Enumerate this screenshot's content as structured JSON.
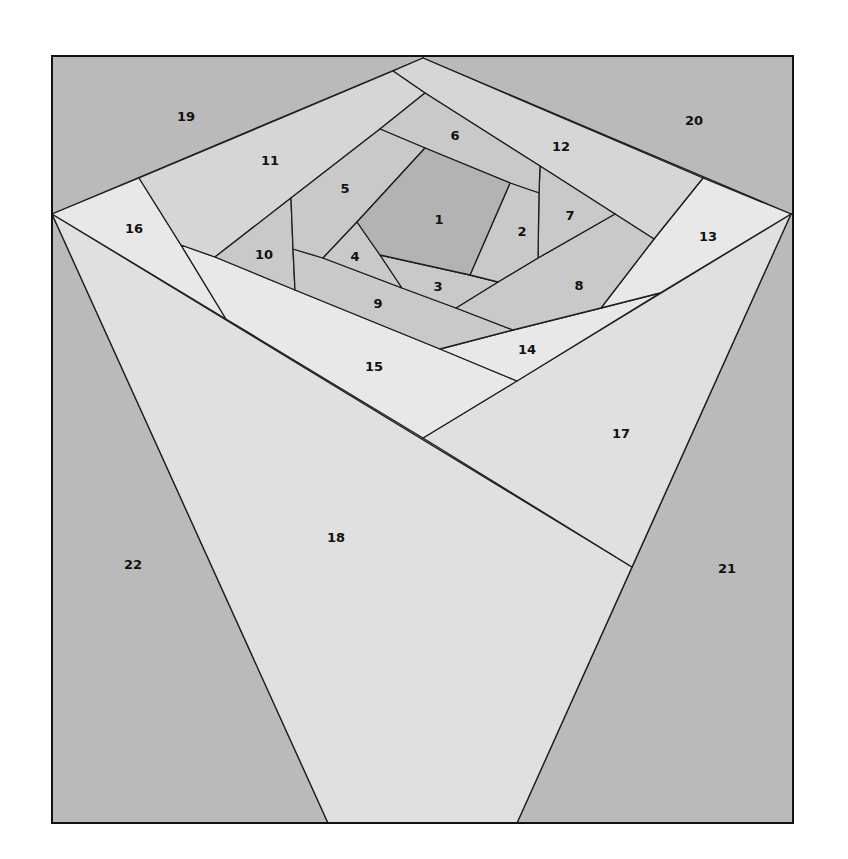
{
  "frame": {
    "x": 52,
    "y": 56,
    "width": 741,
    "height": 767
  },
  "colors": {
    "background": "#bababa",
    "shade_dark": "#b3b3b3",
    "shade_mid": "#c9c9c9",
    "shade_light": "#d6d6d6",
    "shade_lighter": "#e0e0e0",
    "shade_lightest": "#e8e8e8",
    "outline": "#1e1e1e"
  },
  "pieces": [
    {
      "id": "19",
      "label": "19",
      "shade": "background",
      "points": "52,56 423,56 423,58 52,214",
      "label_pos": [
        186,
        116
      ]
    },
    {
      "id": "20",
      "label": "20",
      "shade": "background",
      "points": "423,56 793,56 793,214 791,214 423,58",
      "label_pos": [
        694,
        120
      ]
    },
    {
      "id": "22",
      "label": "22",
      "shade": "background",
      "points": "52,214 328,823 52,823",
      "label_pos": [
        133,
        564
      ]
    },
    {
      "id": "21",
      "label": "21",
      "shade": "background",
      "points": "791,214 793,214 793,823 517,823",
      "label_pos": [
        727,
        568
      ]
    },
    {
      "id": "18",
      "label": "18",
      "shade": "shade_lighter",
      "points": "52,214 632,567 517,823 328,823",
      "label_pos": [
        336,
        537
      ]
    },
    {
      "id": "17",
      "label": "17",
      "shade": "shade_lighter",
      "points": "423,438 791,214 632,567",
      "label_pos": [
        621,
        433
      ]
    },
    {
      "id": "16",
      "label": "16",
      "shade": "shade_lightest",
      "points": "52,214 139,178 181,245 226,319",
      "label_pos": [
        134,
        228
      ]
    },
    {
      "id": "15",
      "label": "15",
      "shade": "shade_lightest",
      "points": "181,245 215,257 295,290 440,349 517,381 423,438 226,319",
      "label_pos": [
        374,
        366
      ]
    },
    {
      "id": "14",
      "label": "14",
      "shade": "shade_lightest",
      "points": "440,349 513,330 601,308 660,293 517,381",
      "label_pos": [
        527,
        349
      ]
    },
    {
      "id": "13",
      "label": "13",
      "shade": "shade_lightest",
      "points": "703,178 791,214 660,293 601,308 654,239",
      "label_pos": [
        708,
        236
      ]
    },
    {
      "id": "12",
      "label": "12",
      "shade": "shade_light",
      "points": "393,71 423,58 703,178 654,239 615,214 540,166 425,93",
      "label_pos": [
        561,
        146
      ]
    },
    {
      "id": "11",
      "label": "11",
      "shade": "shade_light",
      "points": "139,178 393,71 425,93 380,129 291,198 215,257 181,245",
      "label_pos": [
        270,
        160
      ]
    },
    {
      "id": "10",
      "label": "10",
      "shade": "shade_mid",
      "points": "291,198 293,249 295,290 215,257",
      "label_pos": [
        264,
        254
      ]
    },
    {
      "id": "9",
      "label": "9",
      "shade": "shade_mid",
      "points": "293,249 323,258 402,288 456,308 513,330 440,349 295,290",
      "label_pos": [
        378,
        303
      ]
    },
    {
      "id": "8",
      "label": "8",
      "shade": "shade_mid",
      "points": "615,214 654,239 601,308 513,330 456,308 498,282 538,258",
      "label_pos": [
        579,
        285
      ]
    },
    {
      "id": "7",
      "label": "7",
      "shade": "shade_mid",
      "points": "540,166 615,214 538,258 539,193",
      "label_pos": [
        570,
        215
      ]
    },
    {
      "id": "6",
      "label": "6",
      "shade": "shade_mid",
      "points": "425,93 540,166 539,193 510,183 425,148 380,129",
      "label_pos": [
        455,
        135
      ]
    },
    {
      "id": "5",
      "label": "5",
      "shade": "shade_mid",
      "points": "380,129 425,148 357,222 323,258 293,249 291,198",
      "label_pos": [
        345,
        188
      ]
    },
    {
      "id": "4",
      "label": "4",
      "shade": "shade_mid",
      "points": "357,222 380,255 402,288 323,258",
      "label_pos": [
        355,
        256
      ]
    },
    {
      "id": "3",
      "label": "3",
      "shade": "shade_mid",
      "points": "380,255 470,275 498,282 456,308 402,288",
      "label_pos": [
        438,
        286
      ]
    },
    {
      "id": "2",
      "label": "2",
      "shade": "shade_mid",
      "points": "510,183 539,193 538,258 498,282 470,275",
      "label_pos": [
        522,
        231
      ]
    },
    {
      "id": "1",
      "label": "1",
      "shade": "shade_dark",
      "points": "425,148 510,183 470,275 380,255 357,222",
      "label_pos": [
        439,
        219
      ]
    }
  ]
}
